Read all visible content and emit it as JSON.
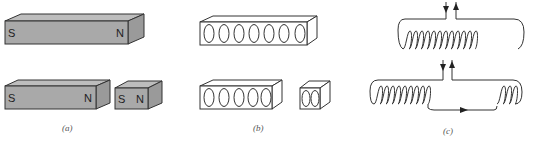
{
  "figure": {
    "panels": [
      {
        "id": "a",
        "caption": "(a)",
        "description": "Bar magnets",
        "magnets": [
          {
            "name": "full-bar-magnet",
            "south_label": "S",
            "north_label": "N"
          },
          {
            "name": "broken-long-piece",
            "south_label": "S",
            "north_label": "N"
          },
          {
            "name": "broken-short-piece",
            "south_label": "S",
            "north_label": "N"
          }
        ],
        "fill_color": "#a9a9a9",
        "top_color": "#bdbdbd",
        "side_color": "#9a9a9a"
      },
      {
        "id": "b",
        "caption": "(b)",
        "description": "Bars of aligned current loops",
        "bars": [
          {
            "name": "full-loop-bar",
            "loop_count": 7
          },
          {
            "name": "broken-loop-bar-long",
            "loop_count": 5
          },
          {
            "name": "broken-loop-bar-short",
            "loop_count": 2
          }
        ]
      },
      {
        "id": "c",
        "caption": "(c)",
        "description": "Solenoid coils with current leads",
        "coils": [
          {
            "name": "solenoid-full",
            "turns": 12,
            "lead_arrows": [
              "down",
              "up"
            ]
          },
          {
            "name": "solenoid-split",
            "turns_left": 9,
            "turns_right": 3,
            "lead_arrows": [
              "down",
              "up"
            ],
            "bottom_arrow": "right"
          }
        ]
      }
    ]
  }
}
